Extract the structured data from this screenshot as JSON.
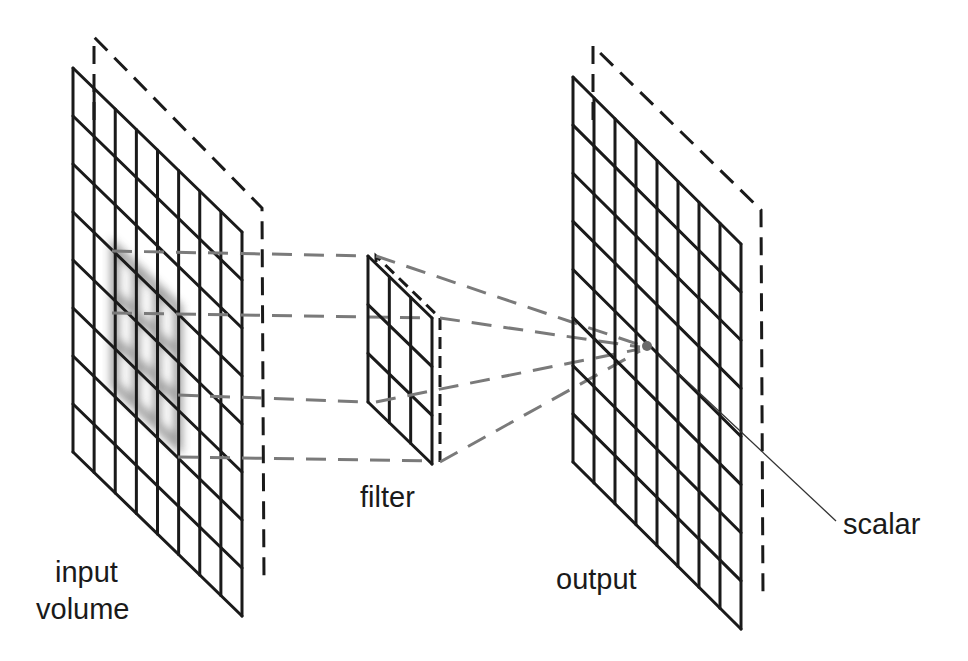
{
  "diagram": {
    "labels": {
      "input_line1": "input",
      "input_line2": "volume",
      "filter": "filter",
      "output": "output",
      "scalar": "scalar"
    },
    "colors": {
      "line": "#1a1a1a",
      "projection": "#7a7a7a",
      "receptive_field": "#8a8a8a",
      "background": "#ffffff"
    },
    "input_grid": {
      "rows": 8,
      "cols": 8
    },
    "filter_grid": {
      "rows": 3,
      "cols": 3
    },
    "output_grid": {
      "rows": 8,
      "cols": 8
    }
  }
}
